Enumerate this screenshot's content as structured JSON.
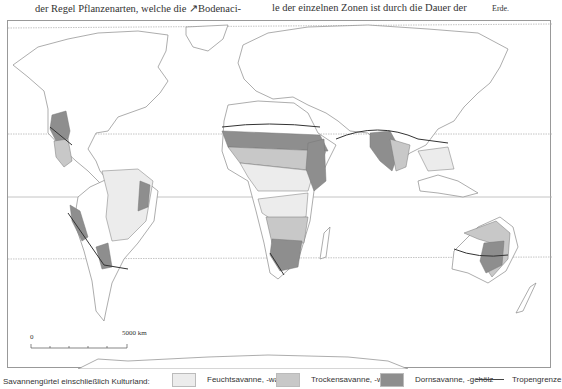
{
  "header_text": {
    "col1": "der Regel Pflanzenarten, welche die ↗Bodenaci-",
    "col2": "le der einzelnen Zonen ist durch die Dauer der",
    "col3": "Erde."
  },
  "map": {
    "scale_bar": {
      "start_label": "0",
      "end_label": "5000 km"
    },
    "colors": {
      "feucht": "#ececec",
      "trocken": "#c8c8c8",
      "dorn": "#8e8e8e",
      "tropengrenze": "#333333",
      "coast": "#8a8a8a",
      "latlines": "#b0b0b0"
    }
  },
  "legend": {
    "title": "Savannengürtel einschließlich Kulturland:",
    "items": [
      {
        "label": "Feuchtsavanne, -wald",
        "color": "#ececec"
      },
      {
        "label": "Trockensavanne, -wald",
        "color": "#c8c8c8"
      },
      {
        "label": "Dornsavanne, -gehölz",
        "color": "#8e8e8e"
      },
      {
        "label": "Tropengrenze",
        "type": "line",
        "color": "#444444"
      }
    ]
  }
}
